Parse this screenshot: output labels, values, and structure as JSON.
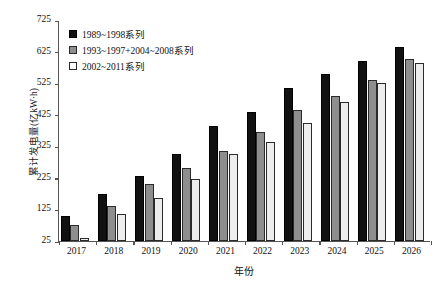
{
  "chart_data": {
    "type": "bar",
    "title": "",
    "xlabel": "年份",
    "ylabel": "累计发电量(亿kW·h)",
    "categories": [
      "2017",
      "2018",
      "2019",
      "2020",
      "2021",
      "2022",
      "2023",
      "2024",
      "2025",
      "2026"
    ],
    "series": [
      {
        "name": "1989~1998系列",
        "color": "#111111",
        "values": [
          105,
          175,
          230,
          300,
          390,
          435,
          510,
          555,
          595,
          640
        ]
      },
      {
        "name": "1993~1997+2004~2008系列",
        "color": "#8e8e8e",
        "values": [
          75,
          135,
          205,
          255,
          310,
          370,
          440,
          485,
          535,
          600
        ]
      },
      {
        "name": "2002~2011系列",
        "color": "#ededed",
        "values": [
          35,
          110,
          160,
          220,
          300,
          340,
          400,
          465,
          525,
          590
        ]
      }
    ],
    "ylim": [
      25,
      725
    ],
    "yticks": [
      25,
      125,
      225,
      325,
      425,
      525,
      625,
      725
    ],
    "grid": false,
    "legend_position": "top-left"
  },
  "legend": {
    "entries": [
      {
        "label": "1989~1998系列",
        "swatch": "filled-black-square"
      },
      {
        "label": "1993~1997+2004~2008系列",
        "swatch": "filled-gray-square"
      },
      {
        "label": "2002~2011系列",
        "swatch": "open-white-square"
      }
    ]
  },
  "axes": {
    "y_title": "累计发电量(亿kW·h)",
    "x_title": "年份"
  }
}
